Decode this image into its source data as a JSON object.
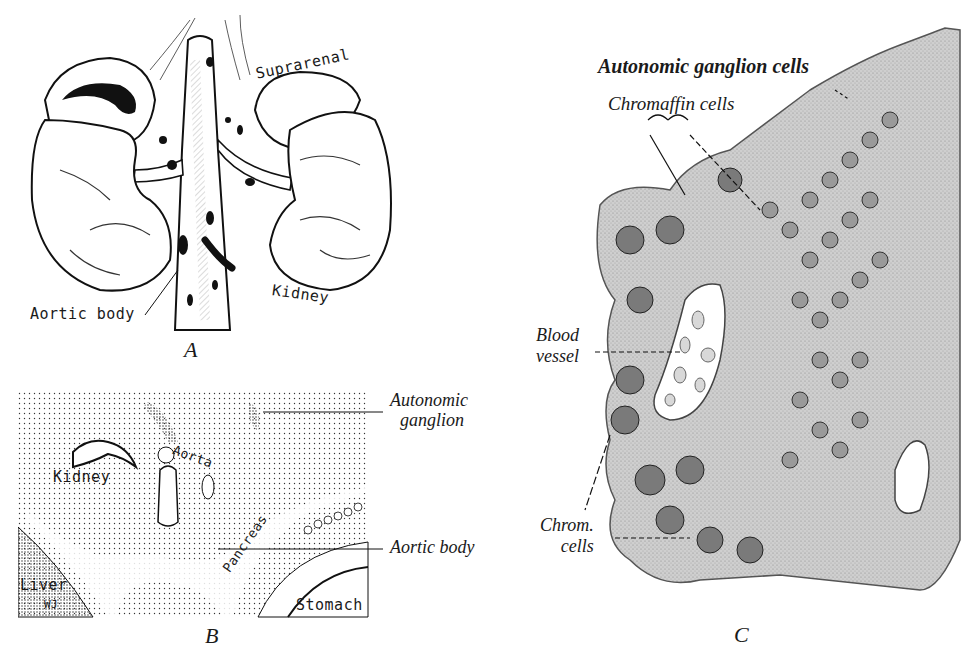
{
  "figure": {
    "panels": [
      {
        "id": "A",
        "caption": "A",
        "labels": {
          "suprarenal": "Suprarenal",
          "kidney": "Kidney",
          "aortic_body": "Aortic body"
        }
      },
      {
        "id": "B",
        "caption": "B",
        "labels": {
          "kidney": "Kidney",
          "aorta": "Aorta",
          "liver": "Liver",
          "initials": "WJ",
          "pancreas": "Pancreas",
          "stomach": "Stomach",
          "autonomic_ganglion_line1": "Autonomic",
          "autonomic_ganglion_line2": "ganglion",
          "aortic_body": "Aortic body"
        }
      },
      {
        "id": "C",
        "caption": "C",
        "labels": {
          "autonomic_ganglion_cells": "Autonomic ganglion cells",
          "chromaffin_cells": "Chromaffin cells",
          "blood_vessel_line1": "Blood",
          "blood_vessel_line2": "vessel",
          "chrom_cells_line1": "Chrom.",
          "chrom_cells_line2": "cells"
        }
      }
    ]
  }
}
